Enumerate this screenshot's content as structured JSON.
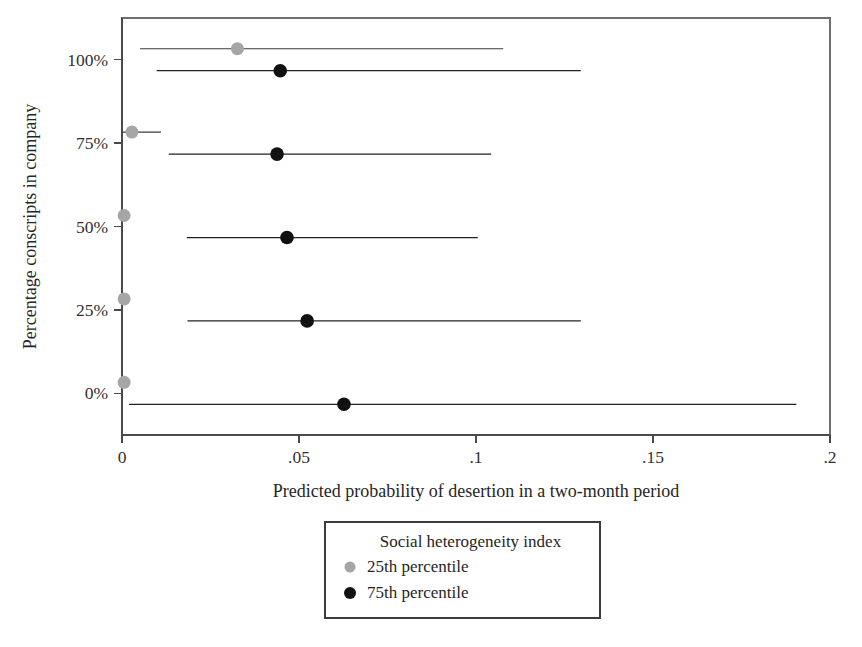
{
  "chart_data": {
    "type": "scatter",
    "title": "",
    "xlabel": "Predicted probability of desertion in a two-month period",
    "ylabel": "Percentage conscripts in company",
    "xlim": [
      0,
      0.2
    ],
    "ylim": [
      -12.5,
      112.5
    ],
    "grid": false,
    "xticks": [
      0,
      0.05,
      0.1,
      0.15,
      0.2
    ],
    "xticklabels": [
      "0",
      ".05",
      ".1",
      ".15",
      ".2"
    ],
    "yticks": [
      0,
      25,
      50,
      75,
      100
    ],
    "yticklabels": [
      "0%",
      "25%",
      "50%",
      "75%",
      "100%"
    ],
    "legend": {
      "title": "Social heterogeneity index",
      "position": "below-axis-center",
      "entries": [
        {
          "label": "25th percentile",
          "color": "#a6a6a6",
          "series": "low"
        },
        {
          "label": "75th percentile",
          "color": "#111111",
          "series": "high"
        }
      ]
    },
    "series": [
      {
        "name": "25th percentile",
        "key": "low",
        "color": "#a6a6a6",
        "points": [
          {
            "y": 100,
            "x": 0.0326,
            "ci_low": 0.0051,
            "ci_high": 0.1077
          },
          {
            "y": 75,
            "x": 0.0028,
            "ci_low": 0.0,
            "ci_high": 0.011
          },
          {
            "y": 50,
            "x": 0.0006,
            "ci_low": 0.0,
            "ci_high": 0.0014
          },
          {
            "y": 25,
            "x": 0.0006,
            "ci_low": 0.0,
            "ci_high": 0.0012
          },
          {
            "y": 0,
            "x": 0.0006,
            "ci_low": 0.0,
            "ci_high": 0.0011
          }
        ]
      },
      {
        "name": "75th percentile",
        "key": "high",
        "color": "#111111",
        "points": [
          {
            "y": 100,
            "x": 0.0447,
            "ci_low": 0.0098,
            "ci_high": 0.1296
          },
          {
            "y": 75,
            "x": 0.0438,
            "ci_low": 0.0132,
            "ci_high": 0.1043
          },
          {
            "y": 50,
            "x": 0.0466,
            "ci_low": 0.0183,
            "ci_high": 0.1005
          },
          {
            "y": 25,
            "x": 0.0523,
            "ci_low": 0.0185,
            "ci_high": 0.1296
          },
          {
            "y": 0,
            "x": 0.0627,
            "ci_low": 0.002,
            "ci_high": 0.1905
          }
        ]
      }
    ]
  },
  "plot_geometry": {
    "left": 122,
    "right": 830,
    "top": 18,
    "bottom": 435,
    "row_offset": 11,
    "dot_radius_low": 6.5,
    "dot_radius_high": 6.8
  },
  "legend_geometry": {
    "x": 325,
    "y": 522,
    "width": 275,
    "height": 96
  }
}
